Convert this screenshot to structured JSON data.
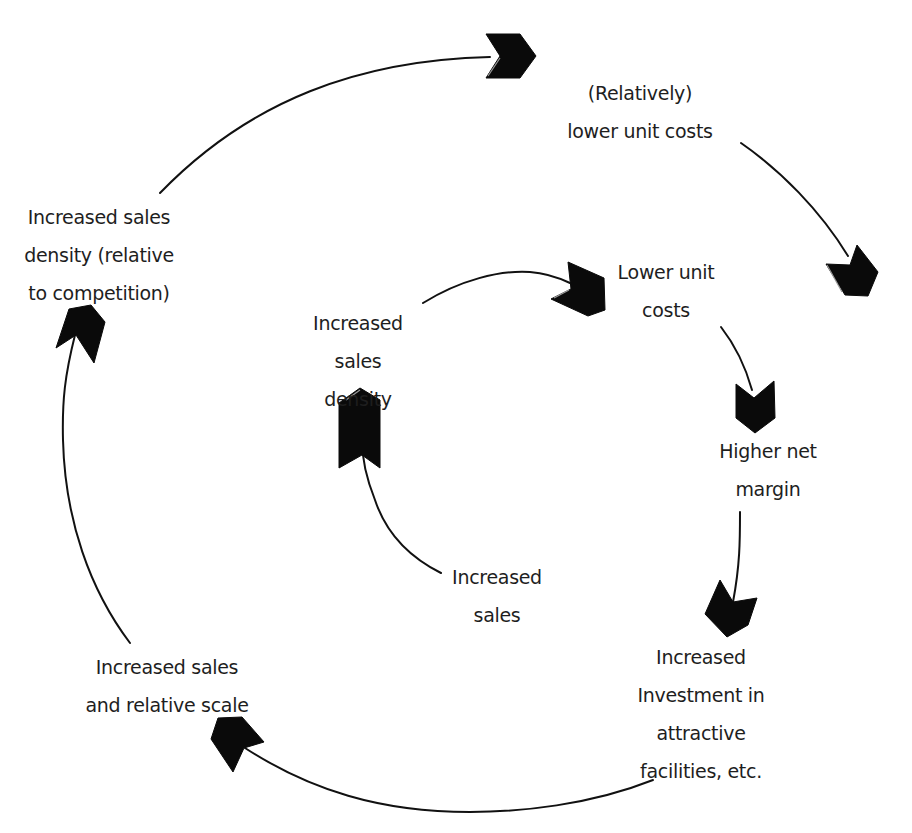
{
  "diagram": {
    "type": "feedback-loop",
    "outer_loop": {
      "nodes": [
        {
          "id": "outer-lower-unit-costs",
          "lines": [
            "(Relatively)",
            "lower unit costs"
          ]
        },
        {
          "id": "investment-facilities",
          "lines": [
            "Increased",
            "Investment in",
            "attractive",
            "facilities, etc."
          ]
        },
        {
          "id": "sales-relative-scale",
          "lines": [
            "Increased sales",
            "and relative scale"
          ]
        },
        {
          "id": "sales-density-relative",
          "lines": [
            "Increased sales",
            "density (relative",
            "to competition)"
          ]
        }
      ],
      "edges": [
        {
          "from": "sales-density-relative",
          "to": "outer-lower-unit-costs"
        },
        {
          "from": "outer-lower-unit-costs",
          "to": "higher-net-margin"
        },
        {
          "from": "higher-net-margin",
          "to": "investment-facilities"
        },
        {
          "from": "investment-facilities",
          "to": "sales-relative-scale"
        },
        {
          "from": "sales-relative-scale",
          "to": "sales-density-relative"
        }
      ]
    },
    "inner_loop": {
      "nodes": [
        {
          "id": "inner-sales-density",
          "lines": [
            "Increased",
            "sales",
            "density"
          ]
        },
        {
          "id": "inner-lower-unit-costs",
          "lines": [
            "Lower unit",
            "costs"
          ]
        },
        {
          "id": "higher-net-margin",
          "lines": [
            "Higher net",
            "margin"
          ]
        },
        {
          "id": "increased-sales",
          "lines": [
            "Increased",
            "sales"
          ]
        }
      ],
      "edges": [
        {
          "from": "inner-sales-density",
          "to": "inner-lower-unit-costs"
        },
        {
          "from": "inner-lower-unit-costs",
          "to": "higher-net-margin"
        },
        {
          "from": "increased-sales",
          "to": "inner-sales-density"
        }
      ]
    },
    "colors": {
      "text": "#1e1e1e",
      "arrow": "#0a0a0a",
      "background": "#ffffff"
    }
  }
}
